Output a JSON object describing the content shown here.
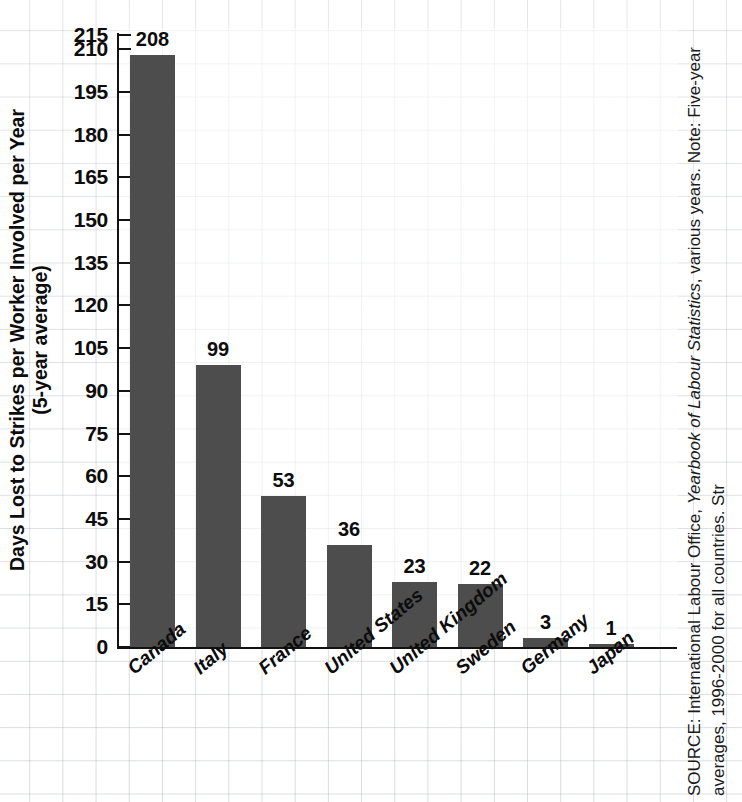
{
  "chart_data": {
    "type": "bar",
    "title": "",
    "categories": [
      "Canada",
      "Italy",
      "France",
      "United States",
      "United Kingdom",
      "Sweden",
      "Germany",
      "Japan"
    ],
    "values": [
      208,
      99,
      53,
      36,
      23,
      22,
      3,
      1
    ],
    "data_labels": [
      "208",
      "99",
      "53",
      "36",
      "23",
      "22",
      "3",
      "1"
    ],
    "xlabel": "",
    "ylabel": "Days Lost to Strikes per Worker Involved per Year (5-year average)",
    "ylabel_line1": "Days Lost to Strikes per Worker Involved per Year",
    "ylabel_line2": "(5-year average)",
    "ylim": [
      0,
      215
    ],
    "ytick_step": 15,
    "yticks": [
      0,
      15,
      30,
      45,
      60,
      75,
      90,
      105,
      120,
      135,
      150,
      165,
      180,
      195,
      210,
      215
    ],
    "ytick_labels": [
      "0",
      "15",
      "30",
      "45",
      "60",
      "75",
      "90",
      "105",
      "120",
      "135",
      "150",
      "165",
      "180",
      "195",
      "210",
      "215"
    ],
    "grid": true,
    "grid_style": "graph-paper",
    "legend": "none",
    "bar_color": "#4d4d4d",
    "axis_color": "#121212",
    "text_color": "#0c0c0c"
  },
  "source": {
    "prefix": "SOURCE: International Labour Office, ",
    "italic_title": "Yearbook of Labour Statistics",
    "suffix": ", various years. Note: Five-year",
    "line2": "averages, 1996-2000 for all countries. Str"
  }
}
